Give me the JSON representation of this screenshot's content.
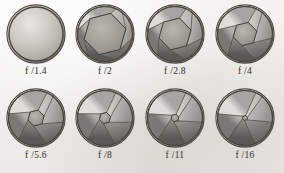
{
  "figure": {
    "type": "aperture-series-diagram",
    "background_color": "#f2f1ee",
    "ink_color": "#4a4742",
    "blade_count": 6,
    "rows": 2,
    "columns": 4
  },
  "apertures": [
    {
      "label": "f /1.4",
      "fstop": 1.4,
      "opening_ratio": 1.0,
      "opening_shape": "circle",
      "blades_visible": 0,
      "description": "fully open, blades retracted out of view"
    },
    {
      "label": "f /2",
      "fstop": 2,
      "opening_ratio": 0.78,
      "opening_shape": "hexagon",
      "blades_visible": 6,
      "description": "blades just entering, large hexagonal opening"
    },
    {
      "label": "f /2.8",
      "fstop": 2.8,
      "opening_ratio": 0.6,
      "opening_shape": "hexagon",
      "blades_visible": 6,
      "description": "hexagonal opening, blades closing inward"
    },
    {
      "label": "f /4",
      "fstop": 4,
      "opening_ratio": 0.44,
      "opening_shape": "hexagon",
      "blades_visible": 6,
      "description": "medium hexagonal opening"
    },
    {
      "label": "f /5.6",
      "fstop": 5.6,
      "opening_ratio": 0.3,
      "opening_shape": "hexagon",
      "blades_visible": 6,
      "description": "small hexagonal opening"
    },
    {
      "label": "f /8",
      "fstop": 8,
      "opening_ratio": 0.21,
      "opening_shape": "hexagon",
      "blades_visible": 6,
      "description": "smaller hexagonal opening"
    },
    {
      "label": "f /11",
      "fstop": 11,
      "opening_ratio": 0.14,
      "opening_shape": "hexagon",
      "blades_visible": 6,
      "description": "very small opening"
    },
    {
      "label": "f /16",
      "fstop": 16,
      "opening_ratio": 0.09,
      "opening_shape": "hexagon",
      "blades_visible": 6,
      "description": "pinhole-sized opening, nearly closed"
    }
  ]
}
